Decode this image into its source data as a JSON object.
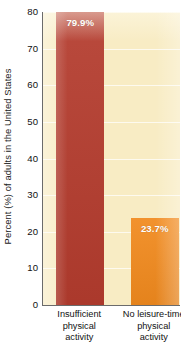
{
  "chart_data": {
    "type": "bar",
    "title": "",
    "subtitle": "",
    "xlabel": "",
    "ylabel": "Percent (%) of adults in the United States",
    "categories": [
      "Insufficient physical activity",
      "No leisure-time physical activity"
    ],
    "category_lines": [
      [
        "Insufficient",
        "physical",
        "activity"
      ],
      [
        "No leisure-time",
        "physical",
        "activity"
      ]
    ],
    "values": [
      79.9,
      23.7
    ],
    "value_labels": [
      "79.9%",
      "23.7%"
    ],
    "bar_colors": [
      "#b43c2e",
      "#f18a1e"
    ],
    "ylim": [
      0,
      80
    ],
    "ytick_values": [
      0,
      10,
      20,
      30,
      40,
      50,
      60,
      70,
      80
    ],
    "ytick_labels": [
      "0",
      "10",
      "20",
      "30",
      "40",
      "50",
      "60",
      "70",
      "80"
    ],
    "grid": true,
    "gridline_color": "#ffffff",
    "legend": false,
    "legend_position": "none",
    "plot_background": "#f8ecc4",
    "axis_color": "#6b6b6b",
    "text_color": "#111111"
  }
}
